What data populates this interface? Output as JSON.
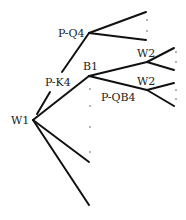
{
  "diagram": {
    "type": "game-tree",
    "nodes": {
      "root": {
        "label": "W1",
        "x": 33,
        "y": 120
      },
      "pq4": {
        "label": "P-Q4",
        "x": 89,
        "y": 33
      },
      "pk4": {
        "label": "P-K4"
      },
      "b1": {
        "label": "B1",
        "x": 89,
        "y": 76
      },
      "w2a": {
        "label": "W2",
        "x": 147,
        "y": 62
      },
      "w2b": {
        "label": "W2",
        "x": 147,
        "y": 90
      },
      "pqb4": {
        "label": "P-QB4"
      }
    },
    "colors": {
      "line": "#111111",
      "text": "#222222",
      "background": "#ffffff"
    }
  }
}
